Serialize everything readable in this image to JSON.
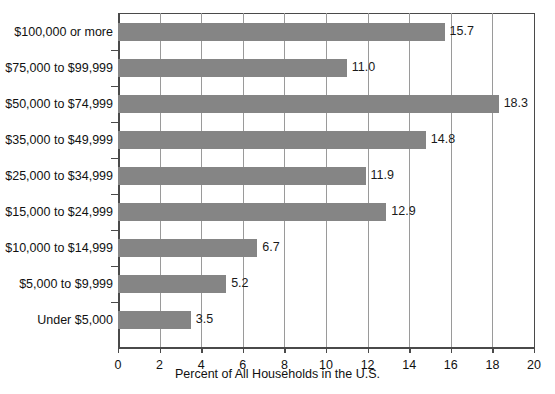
{
  "chart_data": {
    "type": "bar",
    "orientation": "horizontal",
    "title": "",
    "xlabel": "Percent of All Households in the U.S.",
    "ylabel": "",
    "xlim": [
      0,
      20
    ],
    "xticks": [
      "0",
      "2",
      "4",
      "6",
      "8",
      "10",
      "12",
      "14",
      "16",
      "18",
      "20"
    ],
    "grid": "vertical",
    "legend": "none",
    "bar_color": "#858585",
    "categories": [
      "$100,000 or more",
      "$75,000 to $99,999",
      "$50,000 to $74,999",
      "$35,000 to $49,999",
      "$25,000 to $34,999",
      "$15,000 to $24,999",
      "$10,000 to $14,999",
      "$5,000 to $9,999",
      "Under $5,000"
    ],
    "values": [
      15.7,
      11.0,
      18.3,
      14.8,
      11.9,
      12.9,
      6.7,
      5.2,
      3.5
    ],
    "value_labels": [
      "15.7",
      "11.0",
      "18.3",
      "14.8",
      "11.9",
      "12.9",
      "6.7",
      "5.2",
      "3.5"
    ]
  }
}
